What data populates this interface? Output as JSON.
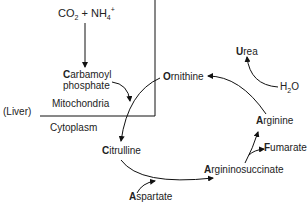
{
  "diagram": {
    "compartments": {
      "organ_label": "(Liver)",
      "upper": "Mitochondria",
      "lower": "Cytoplasm"
    },
    "reactants": {
      "co2": "CO",
      "co2_sub": "2",
      "plus": " + NH",
      "nh4_sub": "4",
      "nh4_sup": "+"
    },
    "nodes": {
      "carbamoyl_initial": "C",
      "carbamoyl_rest": "arbamoyl",
      "carbamoyl_line2": "phosphate",
      "ornithine_initial": "O",
      "ornithine_rest": "rnithine",
      "citrulline_initial": "C",
      "citrulline_rest": "itrulline",
      "aspartate_initial": "A",
      "aspartate_rest": "spartate",
      "argininosuccinate_initial": "A",
      "argininosuccinate_rest": "rgininosuccinate",
      "fumarate_initial": "F",
      "fumarate_rest": "umarate",
      "arginine_initial": "A",
      "arginine_rest": "rginine",
      "urea_initial": "U",
      "urea_rest": "rea",
      "water": "H",
      "water_sub": "2",
      "water_o": "O"
    },
    "colors": {
      "line": "#111111",
      "text": "#222222"
    }
  }
}
